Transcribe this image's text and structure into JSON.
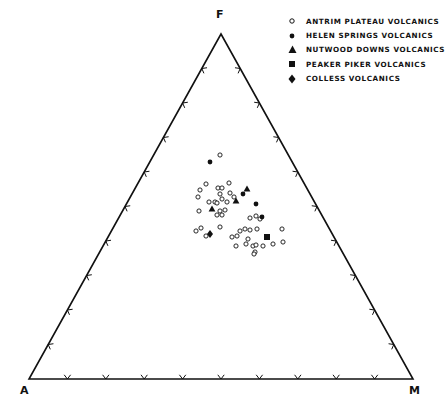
{
  "chart_data": {
    "type": "scatter",
    "subtype": "ternary",
    "title": "",
    "vertices": {
      "top": "F",
      "bottom_left": "A",
      "bottom_right": "M"
    },
    "axes": {
      "F": {
        "range": [
          0,
          100
        ],
        "ticks_per_edge": 9,
        "tick_interval_pct": 10
      },
      "A": {
        "range": [
          0,
          100
        ],
        "ticks_per_edge": 9,
        "tick_interval_pct": 10
      },
      "M": {
        "range": [
          0,
          100
        ],
        "ticks_per_edge": 9,
        "tick_interval_pct": 10
      }
    },
    "grid": false,
    "legend_position": "top-right",
    "legend": [
      {
        "label": "ANTRIM PLATEAU VOLCANICS",
        "marker": "open-circle"
      },
      {
        "label": "HELEN SPRINGS VOLCANICS",
        "marker": "filled-circle"
      },
      {
        "label": "NUTWOOD DOWNS VOLCANICS",
        "marker": "filled-triangle"
      },
      {
        "label": "PEAKER PIKER VOLCANICS",
        "marker": "filled-square"
      },
      {
        "label": "COLLESS VOLCANICS",
        "marker": "filled-diamond"
      }
    ],
    "series": [
      {
        "name": "ANTRIM PLATEAU VOLCANICS",
        "marker": "open-circle",
        "points_px": [
          [
            220,
            155
          ],
          [
            206,
            184
          ],
          [
            200,
            190
          ],
          [
            198,
            197
          ],
          [
            218,
            188
          ],
          [
            222,
            188
          ],
          [
            229,
            183
          ],
          [
            220,
            194
          ],
          [
            230,
            193
          ],
          [
            234,
            197
          ],
          [
            222,
            199
          ],
          [
            215,
            202
          ],
          [
            209,
            202
          ],
          [
            217,
            203
          ],
          [
            227,
            202
          ],
          [
            199,
            211
          ],
          [
            220,
            211
          ],
          [
            225,
            210
          ],
          [
            222,
            215
          ],
          [
            217,
            215
          ],
          [
            220,
            227
          ],
          [
            196,
            231
          ],
          [
            201,
            228
          ],
          [
            206,
            236
          ],
          [
            240,
            231
          ],
          [
            237,
            236
          ],
          [
            232,
            237
          ],
          [
            245,
            229
          ],
          [
            250,
            230
          ],
          [
            257,
            229
          ],
          [
            248,
            239
          ],
          [
            246,
            244
          ],
          [
            236,
            246
          ],
          [
            253,
            246
          ],
          [
            256,
            245
          ],
          [
            255,
            252
          ],
          [
            254,
            254
          ],
          [
            263,
            246
          ],
          [
            273,
            244
          ],
          [
            282,
            229
          ],
          [
            283,
            242
          ],
          [
            256,
            216
          ],
          [
            250,
            218
          ],
          [
            260,
            219
          ]
        ]
      },
      {
        "name": "HELEN SPRINGS VOLCANICS",
        "marker": "filled-circle",
        "points_px": [
          [
            210,
            162
          ],
          [
            243,
            194
          ],
          [
            256,
            204
          ],
          [
            262,
            217
          ]
        ]
      },
      {
        "name": "NUTWOOD DOWNS VOLCANICS",
        "marker": "filled-triangle",
        "points_px": [
          [
            247,
            189
          ],
          [
            236,
            201
          ],
          [
            212,
            209
          ]
        ]
      },
      {
        "name": "PEAKER PIKER VOLCANICS",
        "marker": "filled-square",
        "points_px": [
          [
            267,
            237
          ]
        ]
      },
      {
        "name": "COLLESS VOLCANICS",
        "marker": "filled-diamond",
        "points_px": [
          [
            210,
            234
          ]
        ]
      }
    ],
    "triangle_px": {
      "F": [
        221,
        34
      ],
      "A": [
        29,
        379
      ],
      "M": [
        413,
        379
      ]
    },
    "approx_cluster_composition_pct": {
      "F": [
        38,
        63
      ],
      "A": [
        25,
        45
      ],
      "M": [
        25,
        45
      ]
    }
  },
  "legend": {
    "items": [
      {
        "label": "ANTRIM PLATEAU VOLCANICS"
      },
      {
        "label": "HELEN SPRINGS VOLCANICS"
      },
      {
        "label": "NUTWOOD DOWNS VOLCANICS"
      },
      {
        "label": "PEAKER PIKER VOLCANICS"
      },
      {
        "label": "COLLESS VOLCANICS"
      }
    ]
  },
  "vertex_labels": {
    "top": "F",
    "left": "A",
    "right": "M"
  },
  "colors": {
    "ink": "#111111",
    "background": "#ffffff"
  }
}
